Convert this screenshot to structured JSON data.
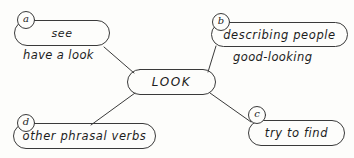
{
  "diagram": {
    "background_color": "#fdfdfb",
    "stroke_color": "#3a3a3a",
    "text_color": "#1c1c1c",
    "center": {
      "label": "LOOK"
    },
    "branches": [
      {
        "tag": "a",
        "label": "see",
        "extra_label": "have a look"
      },
      {
        "tag": "b",
        "label": "describing people",
        "extra_label": "good-looking"
      },
      {
        "tag": "c",
        "label": "try to find",
        "extra_label": ""
      },
      {
        "tag": "d",
        "label": "other phrasal verbs",
        "extra_label": ""
      }
    ]
  }
}
